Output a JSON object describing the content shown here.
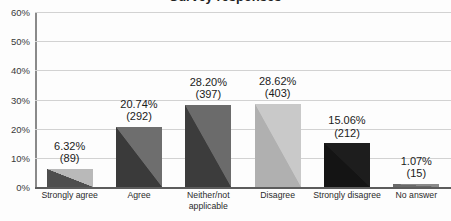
{
  "title_fragment": "Survey responses",
  "chart_data": {
    "type": "bar",
    "title": "",
    "xlabel": "",
    "ylabel": "",
    "ylim": [
      0,
      60
    ],
    "yticks": [
      "0%",
      "10%",
      "20%",
      "30%",
      "40%",
      "50%",
      "60%"
    ],
    "ytick_values": [
      0,
      10,
      20,
      30,
      40,
      50,
      60
    ],
    "grid": true,
    "legend": "none",
    "categories": [
      "Strongly agree",
      "Agree",
      "Neither/not applicable",
      "Disagree",
      "Strongly disagree",
      "No answer"
    ],
    "values": [
      6.32,
      20.74,
      28.2,
      28.62,
      15.06,
      1.07
    ],
    "counts": [
      89,
      292,
      397,
      403,
      212,
      15
    ],
    "labels": [
      {
        "pct": "6.32%",
        "count": "(89)"
      },
      {
        "pct": "20.74%",
        "count": "(292)"
      },
      {
        "pct": "28.20%",
        "count": "(397)"
      },
      {
        "pct": "28.62%",
        "count": "(403)"
      },
      {
        "pct": "15.06%",
        "count": "(212)"
      },
      {
        "pct": "1.07%",
        "count": "(15)"
      }
    ],
    "bar_colors_light": [
      "#b9b9b9",
      "#6e6e6e",
      "#6b6b6b",
      "#c9c9c9",
      "#1d1d1d",
      "#8a8a8a"
    ],
    "bar_colors_dark": [
      "#4e4e4e",
      "#3a3a3a",
      "#3c3c3c",
      "#b0b0b0",
      "#141414",
      "#6a6a6a"
    ],
    "axis_color": "#5c5c5c",
    "grid_color": "#d2d2d2"
  }
}
